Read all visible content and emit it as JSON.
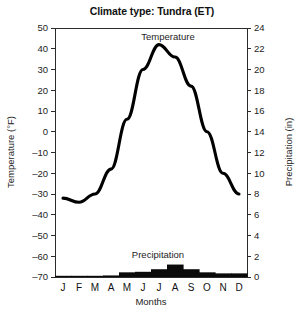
{
  "chart_data": {
    "type": "line",
    "title": "Climate type: Tundra (ET)",
    "xlabel": "Months",
    "ylabel": "Temperature (°F)",
    "y2label": "Precipitation (in)",
    "categories": [
      "J",
      "F",
      "M",
      "A",
      "M",
      "J",
      "J",
      "A",
      "S",
      "O",
      "N",
      "D"
    ],
    "ylim": [
      -70,
      50
    ],
    "yticks": [
      50,
      40,
      30,
      20,
      10,
      0,
      -10,
      -20,
      -30,
      -40,
      -50,
      -60,
      -70
    ],
    "y2lim": [
      0,
      24
    ],
    "y2ticks": [
      24,
      22,
      20,
      18,
      16,
      14,
      12,
      10,
      8,
      6,
      4,
      2,
      0
    ],
    "grid": false,
    "legend": "annotations-inline",
    "series": [
      {
        "name": "Temperature",
        "type": "line",
        "axis": "left",
        "unit": "°F",
        "annotation": "Temperature",
        "values": [
          -32,
          -34,
          -30,
          -18,
          6,
          30,
          42,
          36,
          22,
          0,
          -20,
          -30
        ]
      },
      {
        "name": "Precipitation",
        "type": "bar",
        "axis": "right",
        "unit": "in",
        "annotation": "Precipitation",
        "values": [
          0.1,
          0.1,
          0.1,
          0.15,
          0.45,
          0.5,
          0.75,
          1.2,
          0.75,
          0.45,
          0.35,
          0.35
        ]
      }
    ]
  },
  "colors": {
    "temperature_line": "#000000",
    "precipitation_bar": "#0a0a0a",
    "axis": "#2b2b2b",
    "background": "#ffffff"
  }
}
